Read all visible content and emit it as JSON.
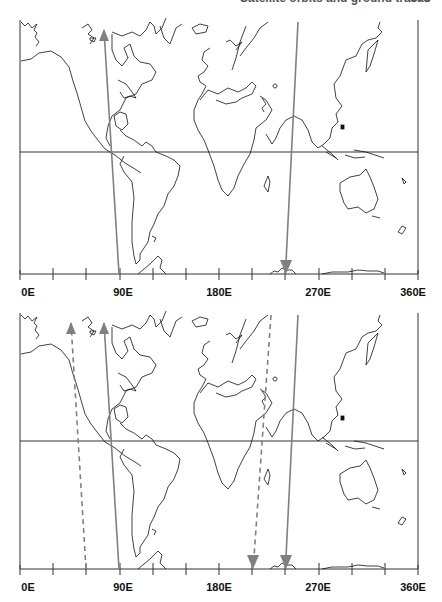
{
  "page_header": {
    "cropped_text": "Satellite orbits and ground tracks",
    "page_number": "000"
  },
  "axis": {
    "unit": "E",
    "labels": [
      {
        "text": "0E",
        "lon": 0
      },
      {
        "text": "90E",
        "lon": 90
      },
      {
        "text": "180E",
        "lon": 180
      },
      {
        "text": "270E",
        "lon": 270
      },
      {
        "text": "360E",
        "lon": 360
      }
    ],
    "tick_spacing_deg": 30,
    "range": [
      0,
      360
    ]
  },
  "colors": {
    "frame": "#333333",
    "coastline": "#111111",
    "arrow": "#808080",
    "background": "#ffffff"
  },
  "panels": [
    {
      "name": "top-panel",
      "description": "Ascending and descending orbit tracks (solid)",
      "tracks": [
        {
          "type": "solid",
          "direction": "ascending",
          "start_lon": 90,
          "end_lon": 75
        },
        {
          "type": "solid",
          "direction": "descending",
          "start_lon": 240,
          "end_lon": 240
        }
      ]
    },
    {
      "name": "bottom-panel",
      "description": "Solid tracks plus shifted dashed tracks",
      "tracks": [
        {
          "type": "solid",
          "direction": "ascending",
          "start_lon": 90,
          "end_lon": 75
        },
        {
          "type": "solid",
          "direction": "descending",
          "start_lon": 240,
          "end_lon": 240
        },
        {
          "type": "dashed",
          "direction": "ascending",
          "start_lon": 60,
          "end_lon": 45
        },
        {
          "type": "dashed",
          "direction": "descending",
          "start_lon": 225,
          "end_lon": 210
        }
      ]
    }
  ]
}
